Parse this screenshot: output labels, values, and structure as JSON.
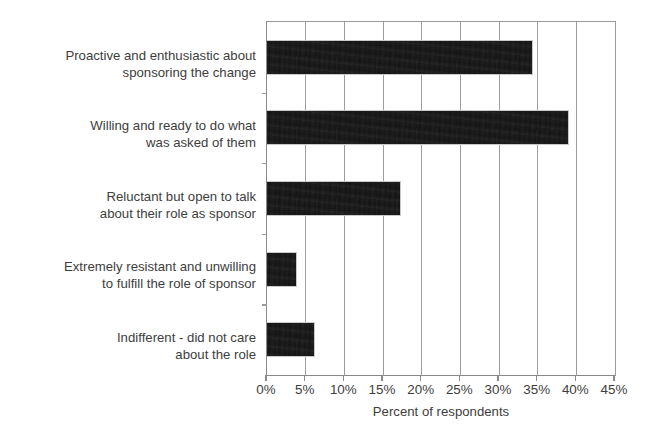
{
  "chart_data": {
    "type": "bar",
    "orientation": "horizontal",
    "title": "",
    "subtitle": "",
    "xlabel": "Percent of respondents",
    "ylabel": "",
    "xlim": [
      0,
      45
    ],
    "xticks": [
      0,
      5,
      10,
      15,
      20,
      25,
      30,
      35,
      40,
      45
    ],
    "xtick_labels": [
      "0%",
      "5%",
      "10%",
      "15%",
      "20%",
      "25%",
      "30%",
      "35%",
      "40%",
      "45%"
    ],
    "grid": "vertical",
    "legend": "none",
    "bar_color": "#141414",
    "grid_color": "#9d9d9d",
    "axis_color": "#8a8a8a",
    "text_color": "#3d3d3d",
    "categories": [
      "Proactive and enthusiastic about\nsponsoring the change",
      "Willing and ready to do what\nwas asked of them",
      "Reluctant but open to talk\nabout their role as sponsor",
      "Extremely resistant and unwilling\nto fulfill the role of sponsor",
      "Indifferent - did not care\nabout the role"
    ],
    "values": [
      34.4,
      39.1,
      17.3,
      3.9,
      6.2
    ],
    "value_labels": [
      "34%",
      "39%",
      "17%",
      "4%",
      "6%"
    ]
  }
}
